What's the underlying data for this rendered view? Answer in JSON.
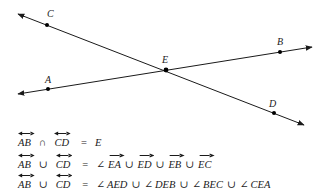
{
  "figure": {
    "lines": [
      {
        "name": "CD",
        "points": [
          "C",
          "E",
          "D"
        ]
      },
      {
        "name": "AB",
        "points": [
          "A",
          "E",
          "B"
        ]
      }
    ],
    "points": [
      {
        "label": "C"
      },
      {
        "label": "A"
      },
      {
        "label": "E"
      },
      {
        "label": "B"
      },
      {
        "label": "D"
      }
    ],
    "stroke_color": "#1a1a1a"
  },
  "equations": [
    {
      "lhs": [
        {
          "text": "AB",
          "over": "line"
        },
        {
          "text": "∩",
          "over": null
        },
        {
          "text": "CD",
          "over": "line"
        }
      ],
      "eq": "=",
      "rhs": [
        {
          "text": "E",
          "over": null
        }
      ]
    },
    {
      "lhs": [
        {
          "text": "AB",
          "over": "line"
        },
        {
          "text": "∪",
          "over": null
        },
        {
          "text": "CD",
          "over": "line"
        }
      ],
      "eq": "=",
      "rhs": [
        {
          "text": "∠",
          "over": null
        },
        {
          "text": "EA",
          "over": "ray"
        },
        {
          "text": "∪",
          "over": null
        },
        {
          "text": "ED",
          "over": "ray"
        },
        {
          "text": "∪",
          "over": null
        },
        {
          "text": "EB",
          "over": "ray"
        },
        {
          "text": "∪",
          "over": null
        },
        {
          "text": "EC",
          "over": "ray"
        }
      ]
    },
    {
      "lhs": [
        {
          "text": "AB",
          "over": "line"
        },
        {
          "text": "∪",
          "over": null
        },
        {
          "text": "CD",
          "over": "line"
        }
      ],
      "eq": "=",
      "rhs": [
        {
          "text": "∠",
          "over": null
        },
        {
          "text": "AED",
          "over": null
        },
        {
          "text": "∪",
          "over": null
        },
        {
          "text": "∠",
          "over": null
        },
        {
          "text": "DEB",
          "over": null
        },
        {
          "text": "∪",
          "over": null
        },
        {
          "text": "∠",
          "over": null
        },
        {
          "text": "BEC",
          "over": null
        },
        {
          "text": "∪",
          "over": null
        },
        {
          "text": "∠",
          "over": null
        },
        {
          "text": "CEA",
          "over": null
        }
      ]
    }
  ]
}
